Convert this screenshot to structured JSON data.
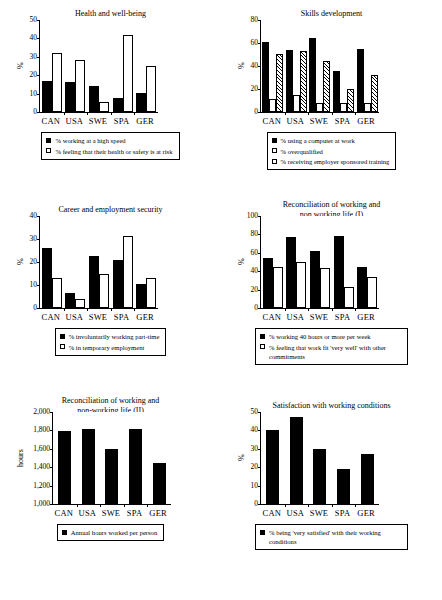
{
  "page": {
    "categories": [
      "CAN",
      "USA",
      "SWE",
      "SPA",
      "GER"
    ]
  },
  "charts": [
    {
      "id": "health-and-well-being",
      "title": "Health and well-being",
      "ylabel": "%",
      "ticks": [
        "0",
        "10",
        "20",
        "30",
        "40",
        "50"
      ],
      "legend": [
        {
          "style": "solid",
          "label": "% working at a high speed"
        },
        {
          "style": "open",
          "label": "% feeling that their health or safety is at risk"
        }
      ]
    },
    {
      "id": "skills-development",
      "title": "Skills development",
      "ylabel": "%",
      "ticks": [
        "0",
        "20",
        "40",
        "60",
        "80"
      ],
      "legend": [
        {
          "style": "solid",
          "label": "% using a computer at work"
        },
        {
          "style": "open",
          "label": "% overqualified"
        },
        {
          "style": "hatch",
          "label": "% receiving employer sponsored training"
        }
      ]
    },
    {
      "id": "career-and-employment-security",
      "title": "Career and employment security",
      "ylabel": "%",
      "ticks": [
        "0",
        "10",
        "20",
        "30",
        "40"
      ],
      "legend": [
        {
          "style": "solid",
          "label": "% involuntarily working part-time"
        },
        {
          "style": "open",
          "label": "% in temporary employment"
        }
      ]
    },
    {
      "id": "reconciliation-working-non-working-life-1",
      "title": "Reconciliation of working and non working life (I)",
      "title_line1": "Reconciliation of working and",
      "title_line2": "non working life (I)",
      "ylabel": "%",
      "ticks": [
        "0",
        "20",
        "40",
        "60",
        "80",
        "100"
      ],
      "legend": [
        {
          "style": "solid",
          "label": "% working 40 hours or more per week"
        },
        {
          "style": "open",
          "label": "% feeling that work fit 'very well' with other commitments"
        }
      ]
    },
    {
      "id": "reconciliation-working-non-working-life-2",
      "title": "Reconciliation of working and non-working life (II)",
      "title_line1": "Reconciliation of working and",
      "title_line2": "non-working life (II)",
      "ylabel": "hours",
      "ticks": [
        "1,000",
        "1,200",
        "1,400",
        "1,600",
        "1,800",
        "2,000"
      ],
      "legend": [
        {
          "style": "solid",
          "label": "Annual hours worked per person"
        }
      ]
    },
    {
      "id": "satisfaction-with-working-conditions",
      "title": "Satisfaction with working conditions",
      "ylabel": "%",
      "ticks": [
        "0",
        "10",
        "20",
        "30",
        "40",
        "50"
      ],
      "legend": [
        {
          "style": "solid",
          "label": "% being 'very satisfied' with their working conditions"
        }
      ]
    }
  ],
  "chart_data": [
    {
      "type": "bar",
      "title": "Health and well-being",
      "xlabel": "",
      "ylabel": "%",
      "ylim": [
        0,
        50
      ],
      "yticks": [
        0,
        10,
        20,
        30,
        40,
        50
      ],
      "grid": false,
      "legend_position": "below",
      "categories": [
        "CAN",
        "USA",
        "SWE",
        "SPA",
        "GER"
      ],
      "series": [
        {
          "name": "% working at a high speed",
          "style": "solid",
          "values": [
            17,
            16.5,
            14,
            7.5,
            10.5
          ]
        },
        {
          "name": "% feeling that their health or safety is at risk",
          "style": "open",
          "values": [
            32,
            28.5,
            5.5,
            42,
            25
          ]
        }
      ]
    },
    {
      "type": "bar",
      "title": "Skills development",
      "xlabel": "",
      "ylabel": "%",
      "ylim": [
        0,
        80
      ],
      "yticks": [
        0,
        20,
        40,
        60,
        80
      ],
      "grid": false,
      "legend_position": "below",
      "categories": [
        "CAN",
        "USA",
        "SWE",
        "SPA",
        "GER"
      ],
      "series": [
        {
          "name": "% using a computer at work",
          "style": "solid",
          "values": [
            61,
            53.5,
            64.5,
            35.5,
            55
          ]
        },
        {
          "name": "% overqualified",
          "style": "open",
          "values": [
            11,
            14.5,
            8,
            7.5,
            8
          ]
        },
        {
          "name": "% receiving employer sponsored training",
          "style": "hatch",
          "values": [
            50.5,
            53,
            44,
            20,
            32
          ]
        }
      ]
    },
    {
      "type": "bar",
      "title": "Career and employment security",
      "xlabel": "",
      "ylabel": "%",
      "ylim": [
        0,
        40
      ],
      "yticks": [
        0,
        10,
        20,
        30,
        40
      ],
      "grid": false,
      "legend_position": "below",
      "categories": [
        "CAN",
        "USA",
        "SWE",
        "SPA",
        "GER"
      ],
      "series": [
        {
          "name": "% involuntarily working part-time",
          "style": "solid",
          "values": [
            26,
            6.5,
            22.5,
            21,
            10.5
          ]
        },
        {
          "name": "% in temporary employment",
          "style": "open",
          "values": [
            13,
            4,
            15,
            31.5,
            13
          ]
        }
      ]
    },
    {
      "type": "bar",
      "title": "Reconciliation of working and non working life (I)",
      "xlabel": "",
      "ylabel": "%",
      "ylim": [
        0,
        100
      ],
      "yticks": [
        0,
        20,
        40,
        60,
        80,
        100
      ],
      "grid": false,
      "legend_position": "below",
      "categories": [
        "CAN",
        "USA",
        "SWE",
        "SPA",
        "GER"
      ],
      "series": [
        {
          "name": "% working 40 hours or more per week",
          "style": "solid",
          "values": [
            54,
            77,
            62,
            78,
            44.5
          ]
        },
        {
          "name": "% feeling that work fit 'very well' with other commitments",
          "style": "open",
          "values": [
            45,
            49.5,
            44,
            22.5,
            34
          ]
        }
      ]
    },
    {
      "type": "bar",
      "title": "Reconciliation of working and non-working life (II)",
      "xlabel": "",
      "ylabel": "hours",
      "ylim": [
        1000,
        2000
      ],
      "yticks": [
        1000,
        1200,
        1400,
        1600,
        1800,
        2000
      ],
      "grid": false,
      "legend_position": "below",
      "categories": [
        "CAN",
        "USA",
        "SWE",
        "SPA",
        "GER"
      ],
      "series": [
        {
          "name": "Annual hours worked per person",
          "style": "solid",
          "values": [
            1790,
            1820,
            1600,
            1820,
            1450
          ]
        }
      ]
    },
    {
      "type": "bar",
      "title": "Satisfaction with working conditions",
      "xlabel": "",
      "ylabel": "%",
      "ylim": [
        0,
        50
      ],
      "yticks": [
        0,
        10,
        20,
        30,
        40,
        50
      ],
      "grid": false,
      "legend_position": "below",
      "categories": [
        "CAN",
        "USA",
        "SWE",
        "SPA",
        "GER"
      ],
      "series": [
        {
          "name": "% being 'very satisfied' with their working conditions",
          "style": "solid",
          "values": [
            40,
            47.5,
            30,
            19,
            27
          ]
        }
      ]
    }
  ]
}
